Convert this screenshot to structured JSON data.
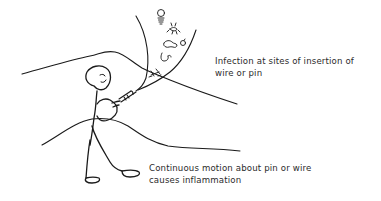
{
  "figure": {
    "annotations": [
      {
        "id": "infection",
        "lines": [
          "Infection at sites of insertion of",
          "wire or pin"
        ]
      },
      {
        "id": "motion",
        "lines": [
          "Continuous motion about pin or wire",
          "causes inflammation"
        ]
      }
    ],
    "elements": {
      "figure": "stick-figure",
      "tool": "flashlight-icon",
      "beam": "light-beam",
      "microbes": [
        "bacterium-bulb",
        "bacterium-spider",
        "bacterium-coil",
        "bacterium-ring",
        "bacterium-hook",
        "bacterium-x"
      ],
      "background": [
        "hill-back",
        "hill-front"
      ]
    },
    "colors": {
      "ink": "#1a1a1a",
      "text": "#2b2b2b",
      "background": "#ffffff"
    }
  }
}
